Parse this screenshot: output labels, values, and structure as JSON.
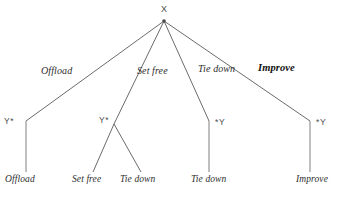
{
  "diagram": {
    "type": "tree",
    "root": {
      "label": "X",
      "x": 164,
      "y": 12
    },
    "edge_labels": [
      {
        "text": "Offload",
        "x": 41,
        "y": 71,
        "bold": false
      },
      {
        "text": "Set free",
        "x": 137,
        "y": 71,
        "bold": false
      },
      {
        "text": "Tie down",
        "x": 198,
        "y": 69,
        "bold": false
      },
      {
        "text": "Improve",
        "x": 259,
        "y": 69,
        "bold": true
      }
    ],
    "mid_nodes": [
      {
        "label": "Y*",
        "x": 4,
        "y": 118
      },
      {
        "label": "Y*",
        "x": 99,
        "y": 117
      },
      {
        "label": "*Y",
        "x": 215,
        "y": 119
      },
      {
        "label": "*Y",
        "x": 316,
        "y": 119
      }
    ],
    "leaves": [
      {
        "text": "Offload",
        "x": 5,
        "y": 177
      },
      {
        "text": "Set free",
        "x": 73,
        "y": 177
      },
      {
        "text": "Tie down",
        "x": 121,
        "y": 177
      },
      {
        "text": "Tie down",
        "x": 192,
        "y": 177
      },
      {
        "text": "Improve",
        "x": 296,
        "y": 177
      }
    ],
    "colors": {
      "background": "#ffffff",
      "edge": "#6b6b6b",
      "stem": "#8a8a8a",
      "text": "#2e2e2e",
      "node_text": "#4f4f4f",
      "emphasis_text": "#111111"
    }
  }
}
